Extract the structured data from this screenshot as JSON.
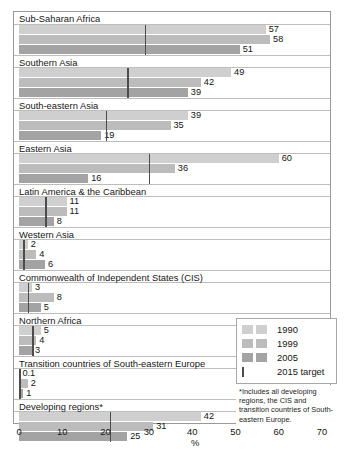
{
  "chart_data": {
    "type": "bar",
    "orientation": "horizontal",
    "title": "",
    "xlabel": "%",
    "ylabel": "",
    "xlim": [
      0,
      70
    ],
    "xticks": [
      0,
      10,
      20,
      30,
      40,
      50,
      60,
      70
    ],
    "grid": false,
    "legend_position": "inside-bottom-right",
    "series": [
      {
        "name": "1990",
        "color": "#cfcfcf"
      },
      {
        "name": "1999",
        "color": "#bcbcbc"
      },
      {
        "name": "2005",
        "color": "#a3a3a3"
      }
    ],
    "target_marker": {
      "label": "2015 target",
      "color": "#4c4c4c"
    },
    "categories": [
      "Sub-Saharan Africa",
      "Southern Asia",
      "South-eastern Asia",
      "Eastern Asia",
      "Latin America & the Caribbean",
      "Western Asia",
      "Commonwealth of Independent States (CIS)",
      "Northern Africa",
      "Transition countries of South-eastern Europe",
      "Developing regions*"
    ],
    "groups": [
      {
        "label": "Sub-Saharan Africa",
        "values": [
          57,
          58,
          51
        ],
        "value_labels": [
          "57",
          "58",
          "51"
        ],
        "target": 29
      },
      {
        "label": "Southern Asia",
        "values": [
          49,
          42,
          39
        ],
        "value_labels": [
          "49",
          "42",
          "39"
        ],
        "target": 25
      },
      {
        "label": "South-eastern Asia",
        "values": [
          39,
          35,
          19
        ],
        "value_labels": [
          "39",
          "35",
          "19"
        ],
        "target": 20
      },
      {
        "label": "Eastern Asia",
        "values": [
          60,
          36,
          16
        ],
        "value_labels": [
          "60",
          "36",
          "16"
        ],
        "target": 30
      },
      {
        "label": "Latin America & the Caribbean",
        "values": [
          11,
          11,
          8
        ],
        "value_labels": [
          "11",
          "11",
          "8"
        ],
        "target": 6
      },
      {
        "label": "Western Asia",
        "values": [
          2,
          4,
          6
        ],
        "value_labels": [
          "2",
          "4",
          "6"
        ],
        "target": 1
      },
      {
        "label": "Commonwealth of Independent States (CIS)",
        "values": [
          3,
          8,
          5
        ],
        "value_labels": [
          "3",
          "8",
          "5"
        ],
        "target": 2
      },
      {
        "label": "Northern Africa",
        "values": [
          5,
          4,
          3
        ],
        "value_labels": [
          "5",
          "4",
          "3"
        ],
        "target": 3
      },
      {
        "label": "Transition countries of South-eastern Europe",
        "values": [
          0.1,
          2,
          1
        ],
        "value_labels": [
          "0.1",
          "2",
          "1"
        ],
        "target": 0.1
      },
      {
        "label": "Developing regions*",
        "values": [
          42,
          31,
          25
        ],
        "value_labels": [
          "42",
          "31",
          "25"
        ],
        "target": 21
      }
    ]
  },
  "axis": {
    "unit": "%",
    "tick_labels": [
      "0",
      "10",
      "20",
      "30",
      "40",
      "50",
      "60",
      "70"
    ]
  },
  "legend": {
    "rows": [
      {
        "label": "1990"
      },
      {
        "label": "1999"
      },
      {
        "label": "2005"
      }
    ],
    "target_label": "2015 target"
  },
  "footnote": {
    "text": "*Includes all developing regions, the CIS and transition countries of South-eastern Europe."
  }
}
